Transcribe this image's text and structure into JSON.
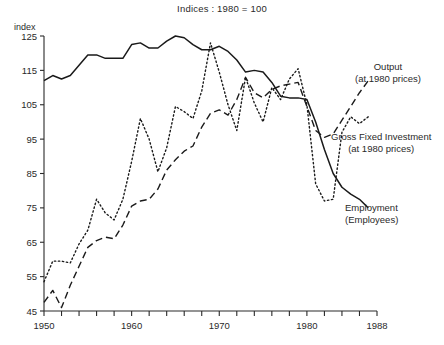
{
  "figure": {
    "title": "Indices : 1980 = 100",
    "axis_unit_label": "index"
  },
  "annotations": {
    "output": {
      "name": "Output",
      "detail": "(at 1980 prices)"
    },
    "gross_fixed_investment": {
      "name": "Gross Fixed Investment",
      "detail": "(at 1980 prices)"
    },
    "employment": {
      "name": "Employment",
      "detail": "(Employees)"
    }
  },
  "chart_data": {
    "type": "line",
    "title": "Indices : 1980 = 100",
    "xlabel": "",
    "ylabel": "index",
    "xlim": [
      1950,
      1988
    ],
    "ylim": [
      45,
      125
    ],
    "yticks": [
      45,
      55,
      65,
      75,
      85,
      95,
      105,
      115,
      125
    ],
    "xticks": [
      1950,
      1960,
      1970,
      1980,
      1988
    ],
    "x_minor_tick_step": 2,
    "grid": false,
    "legend": "annotations at right of plot",
    "x": [
      1950,
      1951,
      1952,
      1953,
      1954,
      1955,
      1956,
      1957,
      1958,
      1959,
      1960,
      1961,
      1962,
      1963,
      1964,
      1965,
      1966,
      1967,
      1968,
      1969,
      1970,
      1971,
      1972,
      1973,
      1974,
      1975,
      1976,
      1977,
      1978,
      1979,
      1980,
      1981,
      1982,
      1983,
      1984,
      1985,
      1986,
      1987
    ],
    "series": [
      {
        "name": "Employment (Employees)",
        "style": "solid",
        "color": "#1a1a1a",
        "values": [
          112,
          113.5,
          112.5,
          113.5,
          116.5,
          119.5,
          119.5,
          118.5,
          118.5,
          118.5,
          122.5,
          123,
          121.5,
          121.5,
          123.5,
          125,
          124.5,
          122.5,
          121,
          121,
          122,
          120.5,
          118,
          114.5,
          115,
          114.5,
          111.5,
          107.5,
          107,
          107,
          106.5,
          100,
          92,
          85,
          81,
          79,
          77.5,
          75
        ]
      },
      {
        "name": "Output (at 1980 prices)",
        "style": "dashed",
        "color": "#1a1a1a",
        "values": [
          47.5,
          51,
          46,
          52.5,
          58,
          63.5,
          65.5,
          66.5,
          66,
          70,
          75.5,
          77,
          77.5,
          80.5,
          86,
          89,
          91.5,
          93,
          98.5,
          102.5,
          103.5,
          102,
          106.5,
          113,
          108.5,
          107,
          109.5,
          110.5,
          111,
          111.5,
          104.5,
          97.5,
          95.5,
          96.5,
          100.5,
          104.5,
          108.5,
          112
        ]
      },
      {
        "name": "Gross Fixed Investment (at 1980 prices)",
        "style": "dotted",
        "color": "#1a1a1a",
        "values": [
          53.5,
          59.5,
          59.5,
          59,
          64.5,
          68.5,
          77.5,
          73.5,
          71.5,
          77.5,
          88.5,
          101,
          95,
          85.5,
          92.5,
          104.5,
          103,
          101,
          109,
          123,
          114.5,
          105,
          97.5,
          113,
          105.5,
          100,
          110,
          106.5,
          112.5,
          115.5,
          105,
          82,
          77,
          77.5,
          97,
          101.5,
          99.5,
          101.5
        ]
      }
    ]
  }
}
